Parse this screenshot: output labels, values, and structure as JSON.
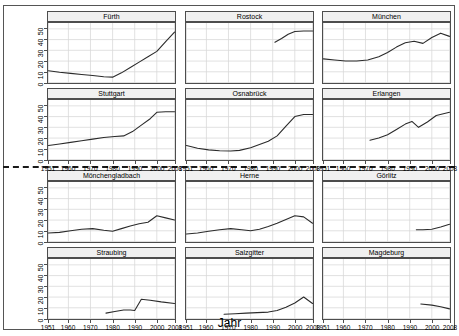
{
  "chart_data": {
    "type": "line",
    "title": "",
    "xlabel": "Jahr",
    "ylabel": "",
    "xlim": [
      1951,
      2008
    ],
    "ylim": [
      0,
      55
    ],
    "grid": true,
    "legend": "none",
    "layout": {
      "rows": 4,
      "cols": 3
    },
    "x_ticks": [
      "1951",
      "1960",
      "1970",
      "1980",
      "1990",
      "2000",
      "2008"
    ],
    "x_tick_values": [
      1951,
      1960,
      1970,
      1980,
      1990,
      2000,
      2008
    ],
    "y_ticks": [
      "0",
      "10",
      "20",
      "30",
      "40",
      "50"
    ],
    "y_tick_values": [
      0,
      10,
      20,
      30,
      40,
      50
    ],
    "panels": [
      {
        "name": "Fürth",
        "x": [
          1951,
          1956,
          1961,
          1966,
          1971,
          1976,
          1980,
          1984,
          1988,
          1992,
          1996,
          2000,
          2004,
          2008
        ],
        "y": [
          11.0,
          9.5,
          8.5,
          7.5,
          6.5,
          5.4,
          5.0,
          9.0,
          14.0,
          19.0,
          24.0,
          29.0,
          38.0,
          47.0
        ]
      },
      {
        "name": "Rostock",
        "x": [
          1991,
          1994,
          1997,
          2000,
          2004,
          2008
        ],
        "y": [
          37.5,
          41.0,
          45.0,
          47.5,
          48.0,
          48.0
        ]
      },
      {
        "name": "München",
        "x": [
          1951,
          1956,
          1961,
          1966,
          1971,
          1976,
          1980,
          1984,
          1988,
          1992,
          1996,
          2000,
          2004,
          2008
        ],
        "y": [
          22.0,
          21.0,
          20.0,
          20.0,
          21.0,
          24.0,
          28.0,
          33.0,
          37.0,
          38.5,
          36.5,
          42.0,
          46.0,
          43.0
        ]
      },
      {
        "name": "Stuttgart",
        "x": [
          1951,
          1956,
          1961,
          1966,
          1971,
          1976,
          1981,
          1985,
          1989,
          1993,
          1997,
          2000,
          2004,
          2008
        ],
        "y": [
          13.0,
          14.5,
          16.0,
          17.5,
          19.0,
          20.5,
          21.5,
          22.0,
          26.0,
          32.0,
          38.0,
          44.0,
          44.5,
          44.5
        ]
      },
      {
        "name": "Osnabrück",
        "x": [
          1951,
          1956,
          1961,
          1966,
          1971,
          1975,
          1980,
          1984,
          1988,
          1992,
          1996,
          2000,
          2004,
          2008
        ],
        "y": [
          13.0,
          10.5,
          9.0,
          8.2,
          8.0,
          8.5,
          11.0,
          14.0,
          17.0,
          22.0,
          31.0,
          40.0,
          42.0,
          42.0
        ]
      },
      {
        "name": "Erlangen",
        "x": [
          1972,
          1976,
          1980,
          1984,
          1988,
          1991,
          1994,
          1998,
          2002,
          2008
        ],
        "y": [
          18.0,
          20.0,
          23.0,
          28.0,
          33.0,
          35.5,
          30.0,
          35.0,
          41.0,
          44.0
        ]
      },
      {
        "name": "Mönchengladbach",
        "x": [
          1951,
          1956,
          1961,
          1966,
          1971,
          1976,
          1980,
          1984,
          1988,
          1992,
          1996,
          2000,
          2004,
          2008
        ],
        "y": [
          8.0,
          8.5,
          10.0,
          11.5,
          12.0,
          10.5,
          9.5,
          12.0,
          14.5,
          16.5,
          18.0,
          24.0,
          22.0,
          20.0
        ]
      },
      {
        "name": "Herne",
        "x": [
          1951,
          1956,
          1961,
          1966,
          1971,
          1976,
          1980,
          1984,
          1988,
          1992,
          1996,
          2000,
          2004,
          2008
        ],
        "y": [
          7.0,
          8.0,
          9.5,
          11.0,
          12.0,
          11.0,
          10.0,
          11.5,
          14.0,
          17.0,
          20.5,
          24.0,
          23.0,
          17.0
        ]
      },
      {
        "name": "Görlitz",
        "x": [
          1993,
          1996,
          2000,
          2004,
          2008
        ],
        "y": [
          11.0,
          11.0,
          11.5,
          13.5,
          16.0
        ]
      },
      {
        "name": "Straubing",
        "x": [
          1977,
          1981,
          1985,
          1988,
          1990,
          1993,
          1997,
          2002,
          2008
        ],
        "y": [
          5.0,
          6.5,
          8.0,
          8.0,
          7.5,
          18.0,
          17.0,
          15.5,
          14.0
        ]
      },
      {
        "name": "Salzgitter",
        "x": [
          1968,
          1973,
          1978,
          1983,
          1988,
          1992,
          1996,
          2000,
          2004,
          2008
        ],
        "y": [
          4.0,
          4.5,
          5.0,
          5.5,
          6.0,
          7.5,
          10.5,
          14.5,
          20.0,
          14.0
        ]
      },
      {
        "name": "Magdeburg",
        "x": [
          1995,
          2000,
          2004,
          2008
        ],
        "y": [
          13.5,
          12.5,
          11.0,
          9.0
        ]
      }
    ]
  },
  "axis": {
    "x_title": "Jahr"
  },
  "style": {
    "line_color": "#2b2b2b",
    "grid_color": "#d9d9d9",
    "strip_bg": "#f0f0f0",
    "border_color": "#4d4d4d",
    "separator_color": "#1a1a1a"
  }
}
